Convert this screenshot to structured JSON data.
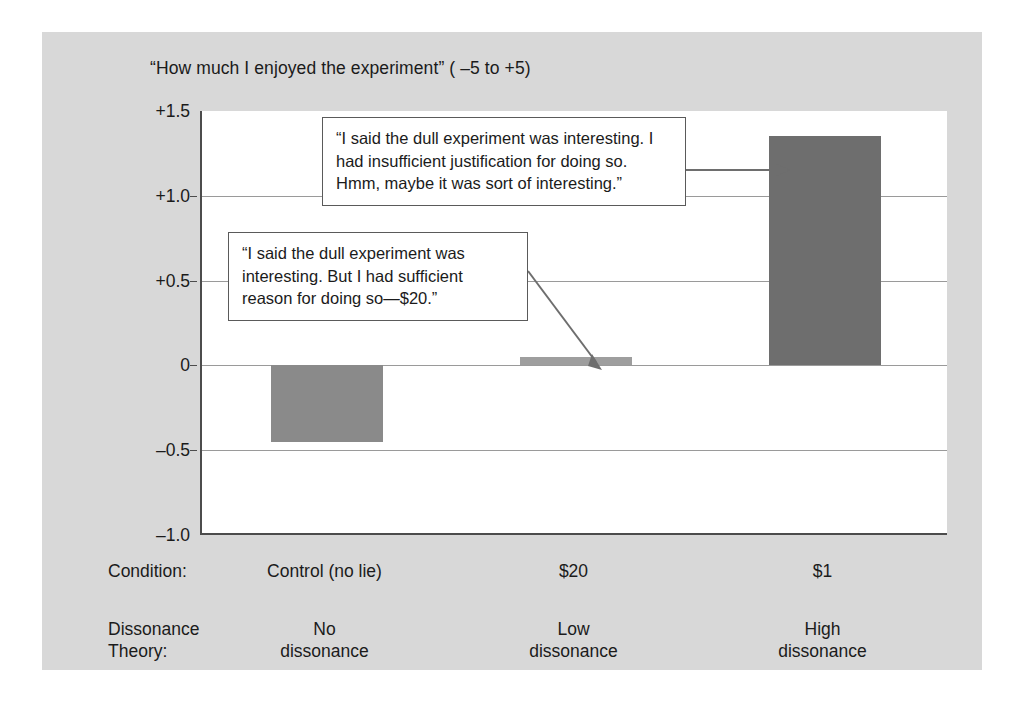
{
  "chart_data": {
    "type": "bar",
    "title": "“How much I enjoyed the experiment” ( –5 to +5)",
    "xlabel": "",
    "ylabel": "",
    "ylim": [
      -1.0,
      1.5
    ],
    "grid": true,
    "legend": "none",
    "categories": [
      "Control (no lie)",
      "$20",
      "$1"
    ],
    "values": [
      -0.45,
      0.05,
      1.35
    ],
    "ytick_labels": [
      "+1.5",
      "+1.0",
      "+0.5",
      "0",
      "–0.5",
      "–1.0"
    ],
    "ytick_values": [
      1.5,
      1.0,
      0.5,
      0,
      -0.5,
      -1.0
    ],
    "bar_colors": [
      "#8a8a8a",
      "#9e9e9e",
      "#6e6e6e"
    ],
    "annotations": [
      {
        "target_category": "$1",
        "text": "“I said the dull experiment was interesting. I had insufficient justification for doing so. Hmm, maybe it was sort of interesting.”"
      },
      {
        "target_category": "$20",
        "text": "“I said the dull experiment was interesting.  But I had sufficient reason for doing so—$20.”"
      }
    ]
  },
  "axis_rows": [
    {
      "header": "Condition:",
      "cells": [
        "Control (no lie)",
        "$20",
        "$1"
      ]
    },
    {
      "header": "Dissonance\nTheory:",
      "cells": [
        "No\ndissonance",
        "Low\ndissonance",
        "High\ndissonance"
      ]
    }
  ],
  "colors": {
    "figure_background": "#d8d8d8",
    "plot_background": "#ffffff",
    "axis": "#4c4c4c",
    "gridline": "#9a9a9a",
    "text": "#1b1b1b",
    "callout_border": "#5a5a5a"
  }
}
